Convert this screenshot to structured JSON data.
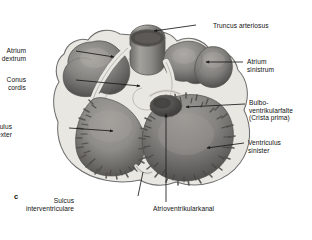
{
  "figure": {
    "panel_label": "c",
    "style": "grayscale-anatomical-illustration",
    "background_color": "#ffffff",
    "ink_color": "#111111"
  },
  "colors": {
    "outline": "#6f6f6f",
    "epicardium_rim": "#e4e2dd",
    "myocardium_light": "#bdbab4",
    "chamber_mid": "#8f8d89",
    "chamber_dark": "#5d5b58",
    "atrium_fill": "#8a8884",
    "atrium_shadow": "#55534f",
    "lumen_dark": "#4a4845",
    "leader_line": "#1a1a1a"
  },
  "labels": [
    {
      "id": "truncus-arteriosus",
      "text": "Truncus arteriosus",
      "align": "left",
      "x": 213,
      "y": 22,
      "leader": {
        "x1": 196,
        "y1": 25,
        "x2": 154,
        "y2": 31,
        "arrow": true
      }
    },
    {
      "id": "atrium-dextrum",
      "text": "Atrium\ndextrum",
      "align": "right",
      "x": 26,
      "y": 47,
      "leader": {
        "x1": 76,
        "y1": 51,
        "x2": 114,
        "y2": 57,
        "arrow": true
      }
    },
    {
      "id": "atrium-sinistrum",
      "text": "Atrium\nsinistrum",
      "align": "left",
      "x": 247,
      "y": 58,
      "leader": {
        "x1": 243,
        "y1": 62,
        "x2": 206,
        "y2": 62,
        "arrow": true
      }
    },
    {
      "id": "conus-cordis",
      "text": "Conus\ncordis",
      "align": "right",
      "x": 26,
      "y": 76,
      "leader": {
        "x1": 76,
        "y1": 80,
        "x2": 140,
        "y2": 86,
        "arrow": true
      }
    },
    {
      "id": "bulboventrikularfalte",
      "text": "Bulbo-\nventrikularfalte\n(Crista prima)",
      "align": "left",
      "x": 249,
      "y": 99,
      "leader": {
        "x1": 245,
        "y1": 104,
        "x2": 186,
        "y2": 107,
        "arrow": true
      }
    },
    {
      "id": "ventriculus-dexter",
      "text": "Ventriculus\ndexter",
      "align": "right",
      "x": 12,
      "y": 123,
      "leader": {
        "x1": 69,
        "y1": 128,
        "x2": 113,
        "y2": 131,
        "arrow": true
      }
    },
    {
      "id": "ventriculus-sinister",
      "text": "Ventriculus\nsinister",
      "align": "left",
      "x": 248,
      "y": 139,
      "leader": {
        "x1": 244,
        "y1": 143,
        "x2": 207,
        "y2": 148,
        "arrow": true
      }
    },
    {
      "id": "sulcus-interventriculare",
      "text": "Sulcus\ninterventriculare",
      "align": "right",
      "x": 74,
      "y": 197,
      "leader": {
        "x1": 138,
        "y1": 196,
        "x2": 143,
        "y2": 172,
        "arrow": false
      }
    },
    {
      "id": "atrioventrikularkanal",
      "text": "Atrioventrikularkanal",
      "align": "left",
      "x": 153,
      "y": 205,
      "leader": {
        "x1": 166,
        "y1": 202,
        "x2": 166,
        "y2": 114,
        "arrow": true
      }
    }
  ]
}
